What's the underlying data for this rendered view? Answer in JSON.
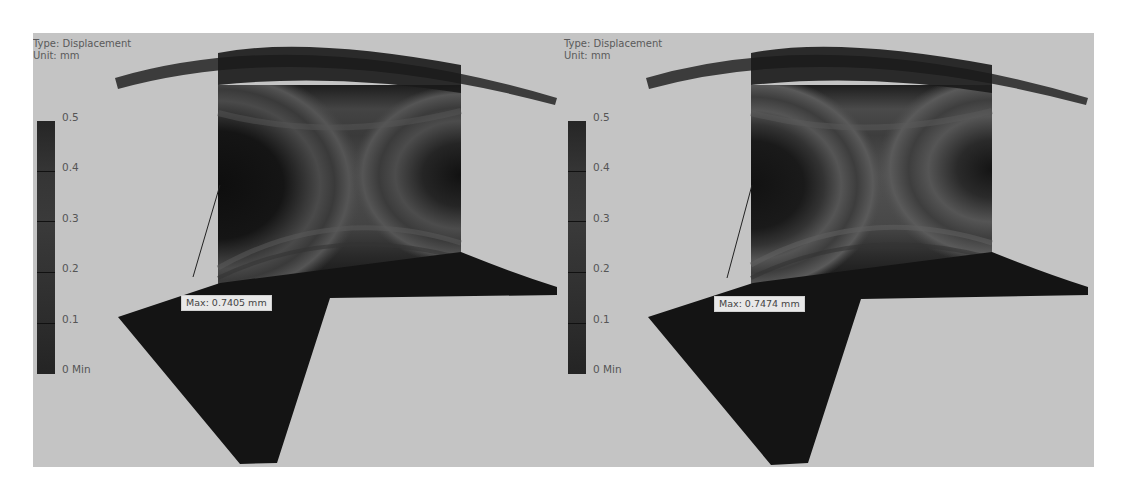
{
  "viewport": {
    "background": "#c4c4c4"
  },
  "panels": [
    {
      "id": "left",
      "legend": {
        "type_label": "Type: Displacement",
        "unit_label": "Unit: mm",
        "ticks": [
          "0.5",
          "0.4",
          "0.3",
          "0.2",
          "0.1",
          "0 Min"
        ]
      },
      "probe": {
        "max_label": "Max: 0.7405 mm"
      }
    },
    {
      "id": "right",
      "legend": {
        "type_label": "Type: Displacement",
        "unit_label": "Unit: mm",
        "ticks": [
          "0.5",
          "0.4",
          "0.3",
          "0.2",
          "0.1",
          "0 Min"
        ]
      },
      "probe": {
        "max_label": "Max: 0.7474 mm"
      }
    }
  ],
  "colors": {
    "model_dark": "#141414",
    "flange_gray": "#3c3c3c",
    "web_band_light": "#5a5a5a",
    "web_band_dark": "#1a1a1a"
  }
}
